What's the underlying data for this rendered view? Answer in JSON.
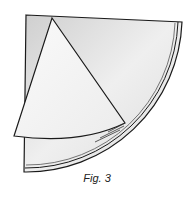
{
  "figure": {
    "caption": "Fig. 3",
    "colors": {
      "line": "#1a1a1a",
      "paper_light": "#f4f4f4",
      "paper_shadow": "#d6d6d6",
      "background": "#ffffff"
    }
  }
}
